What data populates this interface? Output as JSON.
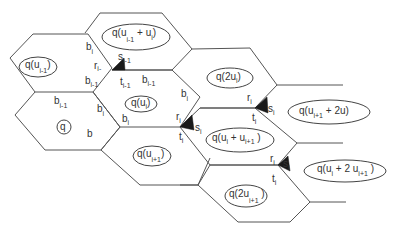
{
  "diagram": {
    "title": "",
    "colors": {
      "line": "#555555",
      "triangle": "#1a1a1a",
      "text": "#333333",
      "background": "#ffffff"
    },
    "cells": [
      {
        "id": "A",
        "label": "q(u",
        "sub": "i-1",
        "close": ")"
      },
      {
        "id": "B",
        "label": "q(u",
        "sub": "i-1",
        "mid": " + u",
        "sub2": "i",
        "close": ")"
      },
      {
        "id": "C",
        "label": "q"
      },
      {
        "id": "D",
        "label": "q(u",
        "sub": "i",
        "close": ")"
      },
      {
        "id": "E",
        "label": "q(2u",
        "sub": "i",
        "close": ")"
      },
      {
        "id": "F",
        "label": "q(u",
        "sub": "i+1",
        "close": ")"
      },
      {
        "id": "G",
        "label": "q(u",
        "sub": "i",
        "mid": " + u",
        "sub2": "i+1",
        "close": " )"
      },
      {
        "id": "H",
        "label": "q(2u",
        "sub": "i+1",
        "close": " )"
      },
      {
        "id": "I",
        "label": "q(u",
        "sub": "i+1",
        "mid": " + 2u",
        "sub2": "i",
        "close": ")"
      },
      {
        "id": "J",
        "label": "q(u",
        "sub": "i",
        "mid": " + 2 u",
        "sub2": "i+1",
        "close": " )"
      }
    ],
    "edge_labels": {
      "b_i_top": {
        "base": "b",
        "sub": "i"
      },
      "r_im1": {
        "base": "r",
        "sub": "i-"
      },
      "s_im1": {
        "base": "s",
        "sub": "i-1"
      },
      "b_im1_a": {
        "base": "b",
        "sub": "i-1"
      },
      "t_im1": {
        "base": "t",
        "sub": "i-1"
      },
      "b_im1_b": {
        "base": "b",
        "sub": "i-1"
      },
      "b_im1_c": {
        "base": "b",
        "sub": "i-1"
      },
      "b_i_c": {
        "base": "b",
        "sub": "i"
      },
      "b": {
        "base": "b"
      },
      "b_i_prime": {
        "base": "b",
        "sub": "i",
        "prime": "'"
      },
      "b_i_d": {
        "base": "b",
        "sub": "i"
      },
      "r_i_1": {
        "base": "r",
        "sub": "i"
      },
      "s_i_1": {
        "base": "s",
        "sub": "i"
      },
      "t_i_1": {
        "base": "t",
        "sub": "i"
      },
      "r_i_2": {
        "base": "r",
        "sub": "i"
      },
      "s_i_2": {
        "base": "s",
        "sub": "i"
      },
      "t_i_2": {
        "base": "t",
        "sub": "i"
      },
      "r_i_3": {
        "base": "r",
        "sub": "i"
      },
      "s_i_3": {
        "base": "s",
        "sub": "i"
      },
      "t_i_3": {
        "base": "t",
        "sub": "i"
      }
    }
  }
}
